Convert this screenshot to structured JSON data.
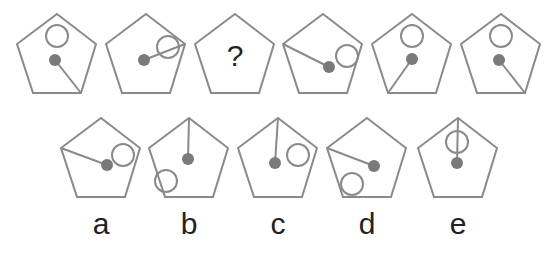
{
  "puzzle": {
    "question_mark": "?",
    "colors": {
      "outline": "#8a8a8a",
      "dot": "#7a7a7a",
      "text": "#222222",
      "background": "#ffffff"
    },
    "sequence": [
      {
        "id": "fig1",
        "x": 17,
        "y": 14,
        "ring": [
          40,
          22
        ],
        "dot": [
          38,
          46
        ],
        "stick_to": "bottom-right"
      },
      {
        "id": "fig2",
        "x": 106,
        "y": 14,
        "ring": [
          62,
          33
        ],
        "dot": [
          38,
          46
        ],
        "stick_to": "right"
      },
      {
        "id": "fig3",
        "x": 195,
        "y": 14,
        "unknown": true
      },
      {
        "id": "fig4",
        "x": 283,
        "y": 14,
        "ring": [
          64,
          42
        ],
        "dot": [
          46,
          53
        ],
        "stick_to": "left"
      },
      {
        "id": "fig5",
        "x": 372,
        "y": 14,
        "ring": [
          40,
          22
        ],
        "dot": [
          40,
          45
        ],
        "stick_to": "bottom-left"
      },
      {
        "id": "fig6",
        "x": 461,
        "y": 14,
        "ring": [
          40,
          22
        ],
        "dot": [
          38,
          46
        ],
        "stick_to": "bottom-right"
      }
    ],
    "options": [
      {
        "label": "a",
        "x": 61,
        "y": 118,
        "ring": [
          62,
          37
        ],
        "dot": [
          46,
          47
        ],
        "stick_to": "left"
      },
      {
        "label": "b",
        "x": 149,
        "y": 118,
        "ring": [
          17,
          63
        ],
        "dot": [
          39,
          41
        ],
        "stick_to": "top"
      },
      {
        "label": "c",
        "x": 238,
        "y": 118,
        "ring": [
          60,
          37
        ],
        "dot": [
          37,
          45
        ],
        "stick_to": "top"
      },
      {
        "label": "d",
        "x": 327,
        "y": 118,
        "ring": [
          25,
          66
        ],
        "dot": [
          47,
          48
        ],
        "stick_to": "left"
      },
      {
        "label": "e",
        "x": 418,
        "y": 118,
        "ring": [
          39,
          24
        ],
        "dot": [
          39,
          45
        ],
        "stick_to": "top"
      }
    ]
  }
}
